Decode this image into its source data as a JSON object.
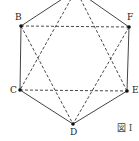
{
  "diagram": {
    "type": "hexagon-with-star",
    "caption": "図 I",
    "colors": {
      "solid": "#444444",
      "dashed": "#333333",
      "point": "#111111"
    },
    "points": {
      "A": {
        "label": "A",
        "x": 76,
        "y": -10,
        "visible_label": false
      },
      "B": {
        "label": "B",
        "x": 21,
        "y": 26
      },
      "C": {
        "label": "C",
        "x": 20,
        "y": 90
      },
      "D": {
        "label": "D",
        "x": 73,
        "y": 124
      },
      "E": {
        "label": "E",
        "x": 127,
        "y": 91
      },
      "F": {
        "label": "F",
        "x": 129,
        "y": 27
      }
    },
    "solid_edges": [
      [
        "A",
        "B"
      ],
      [
        "B",
        "C"
      ],
      [
        "C",
        "D"
      ],
      [
        "D",
        "E"
      ],
      [
        "E",
        "F"
      ],
      [
        "F",
        "A"
      ]
    ],
    "dashed_edges": [
      [
        "B",
        "F"
      ],
      [
        "C",
        "E"
      ],
      [
        "A",
        "C"
      ],
      [
        "A",
        "E"
      ],
      [
        "B",
        "D"
      ],
      [
        "F",
        "D"
      ]
    ]
  }
}
